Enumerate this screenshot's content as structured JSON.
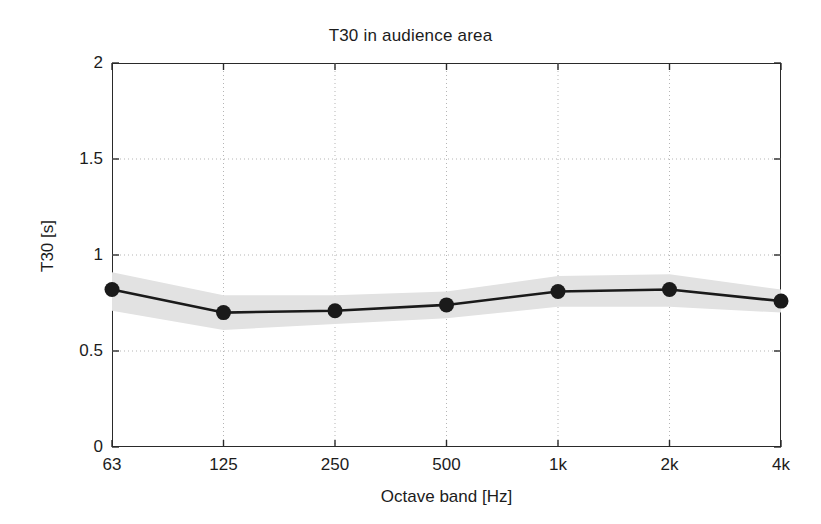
{
  "chart_data": {
    "type": "line",
    "title": "T30 in audience area",
    "xlabel": "Octave band [Hz]",
    "ylabel": "T30 [s]",
    "categories": [
      "63",
      "125",
      "250",
      "500",
      "1k",
      "2k",
      "4k"
    ],
    "values": [
      0.82,
      0.7,
      0.71,
      0.74,
      0.81,
      0.82,
      0.76
    ],
    "band_lower": [
      0.71,
      0.61,
      0.64,
      0.67,
      0.73,
      0.73,
      0.7
    ],
    "band_upper": [
      0.91,
      0.79,
      0.79,
      0.81,
      0.89,
      0.9,
      0.82
    ],
    "band_label": "standard deviation band",
    "ylim": [
      0,
      2
    ],
    "yticks": [
      0,
      0.5,
      1,
      1.5,
      2
    ],
    "ytick_labels": [
      "0",
      "0.5",
      "1",
      "1.5",
      "2"
    ],
    "grid": true,
    "grid_style": "dotted",
    "legend": null,
    "marker": "filled-circle",
    "line_color": "#1a1a1a",
    "band_color": "#e2e2e2",
    "grid_color": "#b5b5b5",
    "axis_color": "#2a2a2a",
    "background": "#ffffff"
  }
}
